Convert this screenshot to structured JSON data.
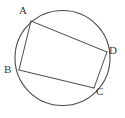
{
  "figure": {
    "background_color": "#ffffff",
    "stroke_color": "#4a4a4a",
    "label_color": "#3a3a3a",
    "circle": {
      "name": "circumscribed-circle",
      "cx": 62.5,
      "cy": 58,
      "r": 47.5,
      "stroke_width": 1.1
    },
    "vertices": [
      {
        "id": "A",
        "label": "A",
        "x": 31,
        "y": 21,
        "label_x": 19,
        "label_y": 5
      },
      {
        "id": "B",
        "label": "B",
        "x": 19,
        "y": 70,
        "label_x": 4,
        "label_y": 64
      },
      {
        "id": "C",
        "label": "C",
        "x": 94,
        "y": 88,
        "label_x": 96,
        "label_y": 86
      },
      {
        "id": "D",
        "label": "D",
        "x": 107,
        "y": 52,
        "label_x": 109,
        "label_y": 45
      }
    ],
    "chords": [
      {
        "id": "AB",
        "from": "A",
        "to": "B",
        "x1": 31,
        "y1": 21,
        "x2": 19,
        "y2": 70
      },
      {
        "id": "AD",
        "from": "A",
        "to": "D",
        "x1": 31,
        "y1": 21,
        "x2": 107,
        "y2": 52
      },
      {
        "id": "BC",
        "from": "B",
        "to": "C",
        "x1": 19,
        "y1": 70,
        "x2": 94,
        "y2": 88
      },
      {
        "id": "CD",
        "from": "C",
        "to": "D",
        "x1": 94,
        "y1": 88,
        "x2": 107,
        "y2": 52
      }
    ],
    "chord_stroke_width": 1
  }
}
